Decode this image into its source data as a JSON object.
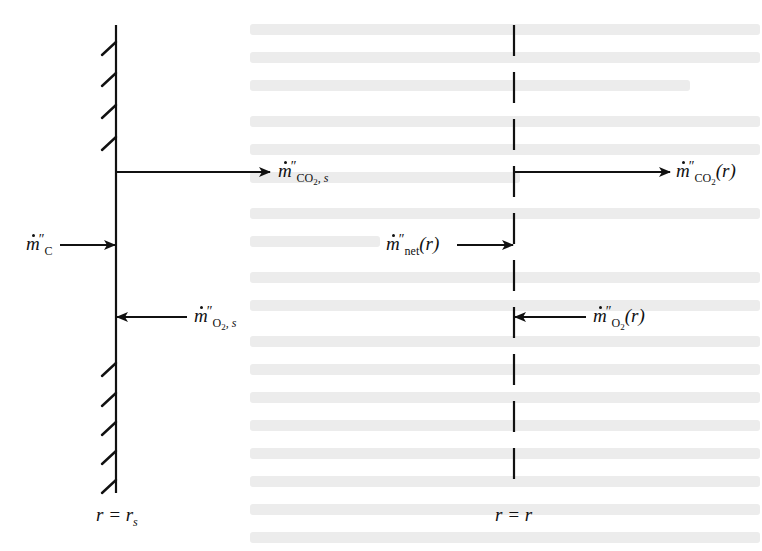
{
  "diagram": {
    "title": "",
    "surfaces": {
      "particle_surface": {
        "kind": "solid-hatched",
        "x": 116,
        "y_top": 25,
        "y_bottom": 493,
        "label": "r = r",
        "label_sub": "s",
        "hatch_y": [
          42,
          73,
          105,
          137,
          363,
          393,
          422,
          451,
          480
        ]
      },
      "control_surface": {
        "kind": "dashed",
        "x": 514,
        "y_top": 25,
        "y_bottom": 493,
        "label": "r = r"
      }
    },
    "fluxes": [
      {
        "id": "co2_s",
        "symbol": "m",
        "prime": "″",
        "subscript": "CO",
        "subscript_sub": "2",
        "subscript_tail": ", s",
        "arg": "",
        "direction": "outward",
        "y": 172,
        "x_from": 116,
        "x_to": 270
      },
      {
        "id": "c",
        "symbol": "m",
        "prime": "″",
        "subscript": "C",
        "subscript_sub": "",
        "subscript_tail": "",
        "arg": "",
        "direction": "inward",
        "y": 245,
        "x_from": 60,
        "x_to": 115
      },
      {
        "id": "o2_s",
        "symbol": "m",
        "prime": "″",
        "subscript": "O",
        "subscript_sub": "2",
        "subscript_tail": ", s",
        "arg": "",
        "direction": "inward",
        "y": 317,
        "x_from": 187,
        "x_to": 117
      },
      {
        "id": "co2_r",
        "symbol": "m",
        "prime": "″",
        "subscript": "CO",
        "subscript_sub": "2",
        "subscript_tail": "",
        "arg": "(r)",
        "direction": "outward",
        "y": 172,
        "x_from": 514,
        "x_to": 670
      },
      {
        "id": "net_r",
        "symbol": "m",
        "prime": "″",
        "subscript": "net",
        "subscript_sub": "",
        "subscript_tail": "",
        "arg": "(r)",
        "direction": "inward",
        "y": 245,
        "x_from": 457,
        "x_to": 513
      },
      {
        "id": "o2_r",
        "symbol": "m",
        "prime": "″",
        "subscript": "O",
        "subscript_sub": "2",
        "subscript_tail": "",
        "arg": "(r)",
        "direction": "inward",
        "y": 317,
        "x_from": 586,
        "x_to": 515
      }
    ],
    "colors": {
      "ink": "#111111",
      "background": "#ffffff",
      "bleed_through": "#e4e4e4"
    }
  }
}
